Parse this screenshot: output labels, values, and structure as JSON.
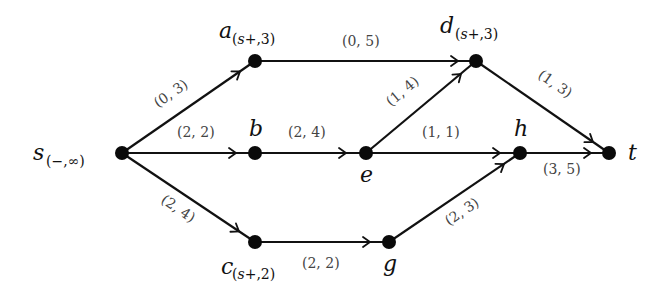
{
  "diagram": {
    "type": "flow-network",
    "nodes": [
      {
        "id": "s",
        "name": "s",
        "label": "(−,∞)",
        "x": 122,
        "y": 153
      },
      {
        "id": "a",
        "name": "a",
        "label": "(s⁺,3)",
        "x": 255,
        "y": 61
      },
      {
        "id": "b",
        "name": "b",
        "label": "",
        "x": 255,
        "y": 153
      },
      {
        "id": "c",
        "name": "c",
        "label": "(s⁺,2)",
        "x": 255,
        "y": 242
      },
      {
        "id": "d",
        "name": "d",
        "label": "(s⁺,3)",
        "x": 476,
        "y": 61
      },
      {
        "id": "e",
        "name": "e",
        "label": "",
        "x": 366,
        "y": 153
      },
      {
        "id": "g",
        "name": "g",
        "label": "",
        "x": 389,
        "y": 242
      },
      {
        "id": "h",
        "name": "h",
        "label": "",
        "x": 520,
        "y": 153
      },
      {
        "id": "t",
        "name": "t",
        "label": "",
        "x": 609,
        "y": 153
      }
    ],
    "edges": [
      {
        "from": "s",
        "to": "a",
        "label": "(0, 3)"
      },
      {
        "from": "s",
        "to": "b",
        "label": "(2, 2)"
      },
      {
        "from": "s",
        "to": "c",
        "label": "(2, 4)"
      },
      {
        "from": "a",
        "to": "d",
        "label": "(0, 5)"
      },
      {
        "from": "b",
        "to": "e",
        "label": "(2, 4)"
      },
      {
        "from": "e",
        "to": "d",
        "label": "(1, 4)"
      },
      {
        "from": "e",
        "to": "h",
        "label": "(1, 1)"
      },
      {
        "from": "d",
        "to": "t",
        "label": "(1, 3)"
      },
      {
        "from": "h",
        "to": "t",
        "label": "(3, 5)"
      },
      {
        "from": "c",
        "to": "g",
        "label": "(2, 2)"
      },
      {
        "from": "g",
        "to": "h",
        "label": "(2, 3)"
      }
    ]
  },
  "labels": {
    "s_name": "s",
    "s_sub": "(−,∞)",
    "a_name": "a",
    "a_sub_open": "(",
    "a_sub_s": "s",
    "a_sub_rest": "+,3)",
    "d_name": "d",
    "d_sub_open": "(",
    "d_sub_s": "s",
    "d_sub_rest": "+,3)",
    "c_name": "c",
    "c_sub_open": "(",
    "c_sub_s": "s",
    "c_sub_rest": "+,2)",
    "b_name": "b",
    "e_name": "e",
    "g_name": "g",
    "h_name": "h",
    "t_name": "t",
    "e_sa": "(0, 3)",
    "e_sb": "(2, 2)",
    "e_sc": "(2, 4)",
    "e_ad": "(0, 5)",
    "e_be": "(2, 4)",
    "e_ed": "(1, 4)",
    "e_eh": "(1, 1)",
    "e_dt": "(1, 3)",
    "e_ht": "(3, 5)",
    "e_cg": "(2, 2)",
    "e_gh": "(2, 3)"
  }
}
